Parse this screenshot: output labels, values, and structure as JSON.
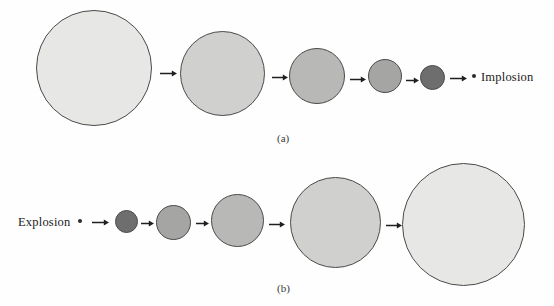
{
  "figure": {
    "background": "#fefefe",
    "outline_color": "#4a4a4a",
    "dot_color": "#2b2b2b",
    "arrow_color": "#1f1f1f",
    "panels": [
      {
        "id": "a",
        "caption": "(a)",
        "caption_x": 277,
        "caption_y": 132,
        "end_label": "Implosion",
        "end_label_x": 481,
        "end_label_y": 70,
        "dot": {
          "x": 472,
          "y": 74
        },
        "circles": [
          {
            "cx": 94,
            "cy": 68,
            "d": 116,
            "fill": "#e7e7e5"
          },
          {
            "cx": 222,
            "cy": 73,
            "d": 85,
            "fill": "#d0d0ce"
          },
          {
            "cx": 317,
            "cy": 76,
            "d": 56,
            "fill": "#b8b8b6"
          },
          {
            "cx": 385,
            "cy": 76,
            "d": 34,
            "fill": "#a5a5a3"
          },
          {
            "cx": 432,
            "cy": 77,
            "d": 25,
            "fill": "#6e6e6e"
          }
        ],
        "arrows": [
          {
            "x": 160,
            "y": 69,
            "w": 17
          },
          {
            "x": 272,
            "y": 73,
            "w": 16
          },
          {
            "x": 350,
            "y": 75,
            "w": 16
          },
          {
            "x": 406,
            "y": 76,
            "w": 13
          },
          {
            "x": 450,
            "y": 74,
            "w": 17
          }
        ]
      },
      {
        "id": "b",
        "caption": "(b)",
        "caption_x": 277,
        "caption_y": 282,
        "start_label": "Explosion",
        "start_label_x": 18,
        "start_label_y": 215,
        "dot": {
          "x": 78,
          "y": 219
        },
        "circles": [
          {
            "cx": 126,
            "cy": 221,
            "d": 23,
            "fill": "#6e6e6e"
          },
          {
            "cx": 173,
            "cy": 222,
            "d": 35,
            "fill": "#a5a5a3"
          },
          {
            "cx": 237,
            "cy": 220,
            "d": 53,
            "fill": "#b8b8b6"
          },
          {
            "cx": 335,
            "cy": 222,
            "d": 91,
            "fill": "#d0d0ce"
          },
          {
            "cx": 463,
            "cy": 224,
            "d": 123,
            "fill": "#e7e7e5"
          }
        ],
        "arrows": [
          {
            "x": 92,
            "y": 218,
            "w": 17
          },
          {
            "x": 141,
            "y": 219,
            "w": 13
          },
          {
            "x": 196,
            "y": 219,
            "w": 13
          },
          {
            "x": 269,
            "y": 220,
            "w": 16
          },
          {
            "x": 386,
            "y": 221,
            "w": 16
          }
        ]
      }
    ]
  }
}
